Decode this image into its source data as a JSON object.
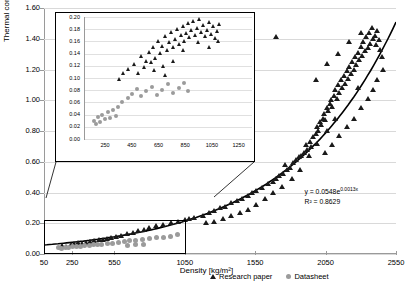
{
  "chart_data": {
    "type": "scatter",
    "title": "",
    "xlabel": "Density [kg/m²]",
    "ylabel": "Thermal conductivity [W/m.K]",
    "xlim": [
      50,
      2550
    ],
    "ylim": [
      0.0,
      1.6
    ],
    "xticks": [
      50,
      250,
      550,
      1050,
      1550,
      2050,
      2550
    ],
    "yticks": [
      "0.00",
      "0.20",
      "0.40",
      "0.60",
      "0.80",
      "1.00",
      "1.20",
      "1.40",
      "1.60"
    ],
    "grid": "horizontal",
    "legend_position": "bottom",
    "series": [
      {
        "name": "Research paper",
        "marker": "triangle",
        "color": "#1a1a1a",
        "points": [
          [
            180,
            0.055
          ],
          [
            210,
            0.05
          ],
          [
            240,
            0.06
          ],
          [
            265,
            0.065
          ],
          [
            290,
            0.07
          ],
          [
            320,
            0.065
          ],
          [
            350,
            0.075
          ],
          [
            380,
            0.08
          ],
          [
            410,
            0.085
          ],
          [
            440,
            0.09
          ],
          [
            470,
            0.095
          ],
          [
            500,
            0.1
          ],
          [
            530,
            0.105
          ],
          [
            560,
            0.11
          ],
          [
            600,
            0.12
          ],
          [
            640,
            0.13
          ],
          [
            680,
            0.14
          ],
          [
            720,
            0.15
          ],
          [
            760,
            0.16
          ],
          [
            800,
            0.17
          ],
          [
            850,
            0.185
          ],
          [
            900,
            0.19
          ],
          [
            950,
            0.2
          ],
          [
            1000,
            0.21
          ],
          [
            1050,
            0.22
          ],
          [
            1080,
            0.23
          ],
          [
            1120,
            0.235
          ],
          [
            1180,
            0.25
          ],
          [
            1220,
            0.27
          ],
          [
            1260,
            0.28
          ],
          [
            1300,
            0.3
          ],
          [
            1340,
            0.31
          ],
          [
            1380,
            0.33
          ],
          [
            1420,
            0.345
          ],
          [
            1460,
            0.36
          ],
          [
            1500,
            0.38
          ],
          [
            1530,
            0.4
          ],
          [
            1560,
            0.41
          ],
          [
            1600,
            0.43
          ],
          [
            1640,
            0.455
          ],
          [
            1680,
            0.47
          ],
          [
            1700,
            0.49
          ],
          [
            1720,
            0.51
          ],
          [
            1750,
            0.52
          ],
          [
            1760,
            0.58
          ],
          [
            1780,
            0.55
          ],
          [
            1800,
            0.56
          ],
          [
            1820,
            0.59
          ],
          [
            1840,
            0.61
          ],
          [
            1860,
            0.63
          ],
          [
            1880,
            0.64
          ],
          [
            1900,
            0.66
          ],
          [
            1910,
            0.71
          ],
          [
            1920,
            0.68
          ],
          [
            1940,
            0.73
          ],
          [
            1950,
            0.7
          ],
          [
            1960,
            0.76
          ],
          [
            1980,
            0.78
          ],
          [
            1990,
            0.83
          ],
          [
            2000,
            0.8
          ],
          [
            2010,
            0.86
          ],
          [
            2020,
            0.84
          ],
          [
            2030,
            0.88
          ],
          [
            2040,
            0.91
          ],
          [
            2050,
            0.87
          ],
          [
            2060,
            0.95
          ],
          [
            2070,
            0.93
          ],
          [
            2080,
            0.98
          ],
          [
            2090,
            1.0
          ],
          [
            2100,
            0.96
          ],
          [
            2110,
            1.03
          ],
          [
            2120,
            1.07
          ],
          [
            2130,
            1.01
          ],
          [
            2140,
            1.1
          ],
          [
            2150,
            1.05
          ],
          [
            2160,
            1.13
          ],
          [
            2170,
            1.08
          ],
          [
            2180,
            1.16
          ],
          [
            2190,
            1.11
          ],
          [
            2200,
            1.19
          ],
          [
            2210,
            1.14
          ],
          [
            2220,
            1.22
          ],
          [
            2230,
            1.17
          ],
          [
            2240,
            1.25
          ],
          [
            2250,
            1.2
          ],
          [
            2260,
            1.28
          ],
          [
            2270,
            1.23
          ],
          [
            2280,
            1.31
          ],
          [
            2290,
            1.26
          ],
          [
            2300,
            1.35
          ],
          [
            2310,
            1.29
          ],
          [
            2320,
            1.38
          ],
          [
            2330,
            1.32
          ],
          [
            2340,
            1.41
          ],
          [
            2350,
            1.34
          ],
          [
            2360,
            1.44
          ],
          [
            2370,
            1.37
          ],
          [
            2380,
            1.47
          ],
          [
            2390,
            1.4
          ],
          [
            2400,
            1.42
          ],
          [
            2410,
            1.36
          ],
          [
            2420,
            1.45
          ],
          [
            2430,
            1.39
          ],
          [
            2440,
            1.33
          ],
          [
            2450,
            1.28
          ],
          [
            2460,
            1.2
          ],
          [
            2300,
            1.44
          ],
          [
            2220,
            1.38
          ],
          [
            2140,
            1.3
          ],
          [
            2060,
            1.24
          ],
          [
            1980,
            1.13
          ],
          [
            2120,
            0.88
          ],
          [
            2060,
            0.8
          ],
          [
            1990,
            0.72
          ],
          [
            1930,
            0.64
          ],
          [
            1870,
            0.55
          ],
          [
            1810,
            0.49
          ],
          [
            1740,
            0.44
          ],
          [
            1680,
            0.4
          ],
          [
            1620,
            0.36
          ],
          [
            1560,
            0.32
          ],
          [
            1500,
            0.29
          ],
          [
            1440,
            0.27
          ],
          [
            1380,
            0.25
          ],
          [
            1320,
            0.23
          ],
          [
            1260,
            0.21
          ],
          [
            1200,
            0.2
          ],
          [
            2350,
            1.01
          ],
          [
            2390,
            1.07
          ],
          [
            2420,
            1.13
          ],
          [
            2300,
            0.95
          ],
          [
            2250,
            0.88
          ],
          [
            2200,
            0.83
          ],
          [
            2150,
            0.77
          ],
          [
            2100,
            0.71
          ],
          [
            2050,
            0.66
          ],
          [
            1700,
            1.41
          ],
          [
            2280,
            1.08
          ]
        ]
      },
      {
        "name": "Datasheet",
        "marker": "circle",
        "color": "#9b9b9b",
        "points": [
          [
            150,
            0.04
          ],
          [
            175,
            0.038
          ],
          [
            200,
            0.042
          ],
          [
            225,
            0.045
          ],
          [
            250,
            0.048
          ],
          [
            280,
            0.05
          ],
          [
            310,
            0.052
          ],
          [
            340,
            0.055
          ],
          [
            370,
            0.058
          ],
          [
            400,
            0.06
          ],
          [
            430,
            0.062
          ],
          [
            460,
            0.065
          ],
          [
            500,
            0.068
          ],
          [
            540,
            0.07
          ],
          [
            580,
            0.075
          ],
          [
            620,
            0.08
          ],
          [
            660,
            0.085
          ],
          [
            700,
            0.09
          ],
          [
            750,
            0.095
          ],
          [
            800,
            0.1
          ],
          [
            850,
            0.105
          ],
          [
            900,
            0.11
          ],
          [
            950,
            0.115
          ],
          [
            1000,
            0.125
          ],
          [
            640,
            0.055
          ],
          [
            700,
            0.06
          ],
          [
            760,
            0.063
          ]
        ]
      }
    ],
    "trendline": {
      "equation": "y = 0.0548e0.0013x",
      "equation_display": "y = 0.0548e",
      "equation_exponent": "0.0013x",
      "r2_label": "R² = ",
      "r2_value": "0.8629"
    }
  },
  "inset": {
    "xticks": [
      250,
      450,
      650,
      850,
      1050,
      1250
    ],
    "yticks": [
      "0.00",
      "0.02",
      "0.04",
      "0.06",
      "0.08",
      "0.10",
      "0.12",
      "0.14",
      "0.16",
      "0.18",
      "0.20"
    ],
    "xlim": [
      100,
      1350
    ],
    "ylim": [
      0.0,
      0.2
    ],
    "series": [
      {
        "name": "Research paper",
        "marker": "triangle",
        "points": [
          [
            430,
            0.115
          ],
          [
            470,
            0.122
          ],
          [
            500,
            0.108
          ],
          [
            520,
            0.135
          ],
          [
            545,
            0.118
          ],
          [
            560,
            0.128
          ],
          [
            580,
            0.142
          ],
          [
            600,
            0.125
          ],
          [
            615,
            0.15
          ],
          [
            630,
            0.133
          ],
          [
            650,
            0.16
          ],
          [
            665,
            0.141
          ],
          [
            680,
            0.152
          ],
          [
            700,
            0.168
          ],
          [
            715,
            0.146
          ],
          [
            730,
            0.158
          ],
          [
            745,
            0.175
          ],
          [
            760,
            0.15
          ],
          [
            775,
            0.163
          ],
          [
            790,
            0.18
          ],
          [
            805,
            0.155
          ],
          [
            820,
            0.17
          ],
          [
            835,
            0.185
          ],
          [
            845,
            0.16
          ],
          [
            860,
            0.174
          ],
          [
            875,
            0.19
          ],
          [
            885,
            0.166
          ],
          [
            900,
            0.178
          ],
          [
            915,
            0.193
          ],
          [
            930,
            0.17
          ],
          [
            945,
            0.182
          ],
          [
            960,
            0.196
          ],
          [
            975,
            0.175
          ],
          [
            990,
            0.186
          ],
          [
            1005,
            0.168
          ],
          [
            1020,
            0.179
          ],
          [
            1035,
            0.191
          ],
          [
            1050,
            0.172
          ],
          [
            1065,
            0.184
          ],
          [
            1080,
            0.165
          ],
          [
            1095,
            0.177
          ],
          [
            1110,
            0.188
          ],
          [
            390,
            0.108
          ],
          [
            360,
            0.098
          ],
          [
            620,
            0.112
          ],
          [
            690,
            0.12
          ],
          [
            840,
            0.145
          ],
          [
            950,
            0.158
          ],
          [
            1030,
            0.15
          ],
          [
            1100,
            0.16
          ],
          [
            760,
            0.128
          ],
          [
            700,
            0.105
          ]
        ]
      },
      {
        "name": "Datasheet",
        "marker": "circle",
        "points": [
          [
            170,
            0.03
          ],
          [
            185,
            0.024
          ],
          [
            200,
            0.036
          ],
          [
            215,
            0.028
          ],
          [
            230,
            0.04
          ],
          [
            250,
            0.032
          ],
          [
            270,
            0.044
          ],
          [
            290,
            0.035
          ],
          [
            310,
            0.048
          ],
          [
            330,
            0.038
          ],
          [
            350,
            0.052
          ],
          [
            380,
            0.06
          ],
          [
            420,
            0.068
          ],
          [
            455,
            0.074
          ],
          [
            490,
            0.082
          ],
          [
            520,
            0.07
          ],
          [
            560,
            0.078
          ],
          [
            600,
            0.086
          ],
          [
            640,
            0.072
          ],
          [
            680,
            0.08
          ],
          [
            720,
            0.09
          ],
          [
            760,
            0.076
          ],
          [
            800,
            0.084
          ],
          [
            840,
            0.092
          ],
          [
            870,
            0.078
          ]
        ]
      }
    ]
  },
  "legend": {
    "items": [
      {
        "label": "Research paper",
        "marker": "triangle"
      },
      {
        "label": "Datasheet",
        "marker": "circle"
      }
    ]
  }
}
